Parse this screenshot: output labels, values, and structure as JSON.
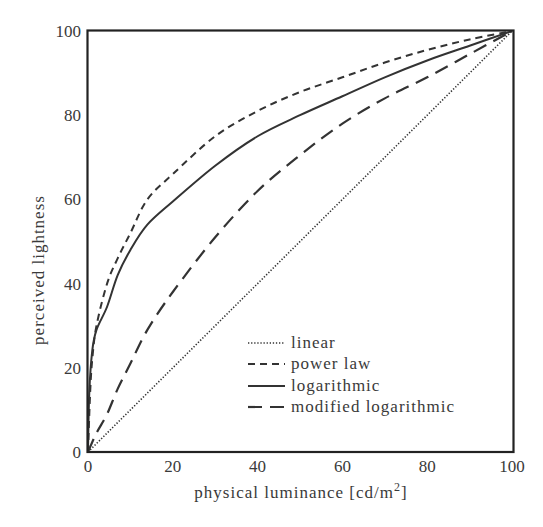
{
  "chart_data": {
    "type": "line",
    "title": "",
    "xlabel": "physical luminance [cd/m²]",
    "xlabel_main": "physical luminance [cd/m",
    "xlabel_sup": "2",
    "xlabel_end": "]",
    "ylabel": "perceived lightness",
    "xlim": [
      0,
      100
    ],
    "ylim": [
      0,
      100
    ],
    "xticks": [
      0,
      20,
      40,
      60,
      80,
      100
    ],
    "yticks": [
      0,
      20,
      40,
      60,
      80,
      100
    ],
    "grid": false,
    "legend_position": "lower right (inside)",
    "series": [
      {
        "name": "linear",
        "style": "dotted",
        "x": [
          0,
          100
        ],
        "y": [
          0,
          100
        ]
      },
      {
        "name": "power law",
        "style": "dashed",
        "x": [
          0,
          0.5,
          1,
          2,
          4.5,
          7,
          10,
          14,
          20,
          30,
          40,
          50,
          60,
          70,
          80,
          90,
          100
        ],
        "y": [
          0,
          14,
          22,
          30,
          40,
          46,
          52,
          60,
          66,
          75,
          81,
          85.5,
          89,
          92.5,
          95.5,
          98,
          100
        ]
      },
      {
        "name": "logarithmic",
        "style": "solid",
        "x": [
          0,
          0.3,
          1,
          2,
          4.5,
          7,
          10,
          14,
          20,
          30,
          40,
          50,
          60,
          70,
          80,
          90,
          100
        ],
        "y": [
          0,
          14,
          24,
          29,
          34.5,
          42,
          48,
          54,
          59.5,
          68,
          75,
          80,
          84.5,
          89,
          93,
          96.5,
          100
        ]
      },
      {
        "name": "modified logarithmic",
        "style": "long-dashed",
        "x": [
          0,
          2,
          4.5,
          7,
          10,
          14,
          20,
          30,
          40,
          50,
          60,
          70,
          80,
          90,
          100
        ],
        "y": [
          0,
          4.5,
          9,
          15,
          21,
          29,
          38,
          51,
          62,
          70.5,
          78,
          84,
          89,
          94.5,
          100
        ]
      }
    ]
  },
  "colors": {
    "line": "#333333",
    "axis": "#222222",
    "text": "#3a3a3a"
  }
}
